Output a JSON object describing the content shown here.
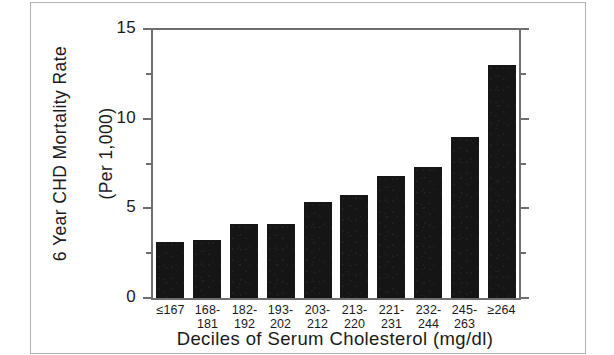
{
  "chart_data": {
    "type": "bar",
    "title": "",
    "xlabel": "Deciles  of  Serum  Cholesterol  (mg/dl)",
    "ylabel_line1": "6 Year  CHD  Mortality  Rate",
    "ylabel_line2": "(Per 1,000)",
    "categories": [
      "≤167",
      "168-181",
      "182-192",
      "193-202",
      "203-212",
      "213-220",
      "221-231",
      "232-244",
      "245-263",
      "≥264"
    ],
    "category_lines": [
      {
        "line1": "≤167",
        "line2": ""
      },
      {
        "line1": "168-",
        "line2": "181"
      },
      {
        "line1": "182-",
        "line2": "192"
      },
      {
        "line1": "193-",
        "line2": "202"
      },
      {
        "line1": "203-",
        "line2": "212"
      },
      {
        "line1": "213-",
        "line2": "220"
      },
      {
        "line1": "221-",
        "line2": "231"
      },
      {
        "line1": "232-",
        "line2": "244"
      },
      {
        "line1": "245-",
        "line2": "263"
      },
      {
        "line1": "≥264",
        "line2": ""
      }
    ],
    "values": [
      3.1,
      3.25,
      4.15,
      4.15,
      5.35,
      5.75,
      6.8,
      7.3,
      9.0,
      13.0
    ],
    "ylim": [
      0,
      15
    ],
    "ytick_major": [
      0,
      5,
      10,
      15
    ],
    "ytick_major_labels": [
      "0",
      "5",
      "10",
      "15"
    ],
    "ytick_minor": [
      2.5,
      7.5,
      12.5
    ],
    "grid": false,
    "legend": false,
    "bar_color": "#151515",
    "axis_color": "#6e6e6e",
    "text_color": "#1a1a1a",
    "background": "#ffffff"
  }
}
